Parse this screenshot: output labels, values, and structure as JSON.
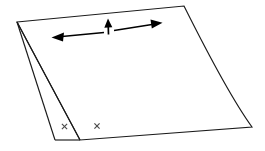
{
  "figure": {
    "background_color": "#ffffff",
    "line_color": "#1a1a1a",
    "arrow_color": "#000000",
    "x_mark_color": "#4a4a4a",
    "canvas": {
      "width": 265,
      "height": 151
    }
  },
  "sheet": {
    "name": "folded-sheet",
    "main_face_points": "17,22 184,6 252,127 80,140",
    "right_edge_curve": "M 184,6 C 198,34 228,94 252,127",
    "flap_points": "17,22 55,140 80,140",
    "flap_bottom_edge": "M 55,140 L 80,140",
    "outer_fold_line": "M 17,22 L 55,140",
    "inner_fold_line": "M 17,22 L 80,140",
    "top_edge": "M 17,22 L 184,6",
    "bottom_edge": "M 80,140 L 252,127"
  },
  "arrows": {
    "left": {
      "label": "left-stretch-arrow",
      "shaft": {
        "x1": 104,
        "y1": 32.5,
        "x2": 62,
        "y2": 36.5
      },
      "head": "51.5,37.5 64,32.6 63,41.4",
      "direction": "left"
    },
    "up": {
      "label": "up-arrow",
      "shaft": {
        "x1": 108.5,
        "y1": 34.5,
        "x2": 108.2,
        "y2": 25.0
      },
      "head": "108.0,18.5 104.3,27.8 112.3,27.2",
      "direction": "up"
    },
    "right": {
      "label": "right-stretch-arrow",
      "shaft": {
        "x1": 114,
        "y1": 30.5,
        "x2": 152,
        "y2": 24.5
      },
      "head": "162.5,22.8 150.5,19.6 151.8,28.4",
      "direction": "right"
    }
  },
  "markers": [
    {
      "name": "x-marker-left",
      "cx": 64.5,
      "cy": 126.5,
      "size": 5.2
    },
    {
      "name": "x-marker-right",
      "cx": 97.0,
      "cy": 126.0,
      "size": 5.2
    }
  ]
}
